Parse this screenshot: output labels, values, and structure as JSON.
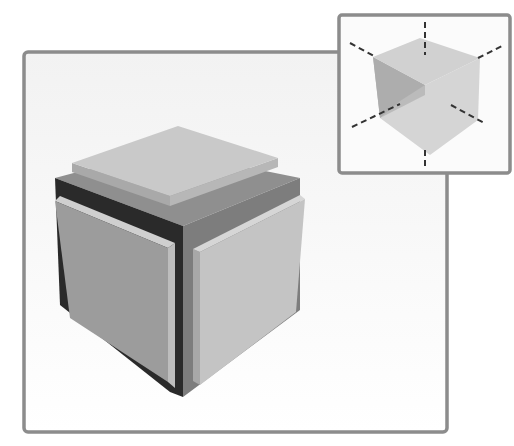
{
  "canvas": {
    "width": 514,
    "height": 446,
    "background": "#ffffff"
  },
  "main_panel": {
    "label": "exploded-cube-view",
    "frame": {
      "x": 24,
      "y": 52,
      "w": 423,
      "h": 380,
      "rx": 4,
      "stroke": "#8c8c8c",
      "stroke_width": 3.5,
      "fill_top": "#f2f2f2",
      "fill_bottom": "#ffffff"
    },
    "core": {
      "top": {
        "points": "55,178 160,150 300,178 183,226",
        "fill": "#8f8f8f"
      },
      "left": {
        "points": "55,178 183,226 183,397 170,392 60,305",
        "fill": "#2a2a2a"
      },
      "right": {
        "points": "183,226 300,178 300,310 183,397",
        "fill": "#7d7d7d"
      }
    },
    "plates": {
      "top": {
        "face": {
          "points": "72,163 178,126 278,158 170,196",
          "fill": "#c9c9c9"
        },
        "edge_front_left": {
          "points": "72,163 170,196 170,206 72,172",
          "fill": "#a9a9a9"
        },
        "edge_front_right": {
          "points": "170,196 278,158 278,167 170,206",
          "fill": "#b7b7b7"
        }
      },
      "left": {
        "face": {
          "points": "55,201 168,248 168,382 70,318",
          "fill": "#9c9c9c"
        },
        "edge": {
          "points": "55,201 60,196 175,243 168,248",
          "fill": "#cfcfcf"
        },
        "side": {
          "points": "168,248 175,243 175,388 168,382",
          "fill": "#bdbdbd"
        }
      },
      "right": {
        "face": {
          "points": "200,252 305,199 296,312 200,385",
          "fill": "#c4c4c4"
        },
        "edge": {
          "points": "193,249 300,195 305,199 200,252",
          "fill": "#d6d6d6"
        },
        "side": {
          "points": "193,249 200,252 200,385 193,381",
          "fill": "#a8a8a8"
        }
      }
    }
  },
  "inset_panel": {
    "label": "axes-reference-cube",
    "frame": {
      "x": 339,
      "y": 15,
      "w": 171,
      "h": 158,
      "rx": 3,
      "stroke": "#8c8c8c",
      "stroke_width": 3.5,
      "fill": "#fbfbfb"
    },
    "cube": {
      "top": {
        "points": "373,57 420,38 480,58 425,85",
        "fill": "#cfcfcf"
      },
      "left": {
        "points": "373,57 425,85 425,95 380,118",
        "fill": "#b8b8b8"
      },
      "back": {
        "points": "425,85 480,58 478,120 430,155 380,118",
        "fill": "#d3d3d3"
      },
      "shade": {
        "points": "373,57 425,85 400,101 380,118",
        "fill": "#a9a9a9"
      }
    },
    "axes": [
      {
        "name": "vertical-up",
        "x1": 425,
        "y1": 22,
        "x2": 425,
        "y2": 55
      },
      {
        "name": "vertical-down",
        "x1": 425,
        "y1": 150,
        "x2": 425,
        "y2": 168
      },
      {
        "name": "left-up",
        "x1": 350,
        "y1": 43,
        "x2": 374,
        "y2": 56
      },
      {
        "name": "right-up",
        "x1": 478,
        "y1": 58,
        "x2": 504,
        "y2": 45
      },
      {
        "name": "left-down",
        "x1": 352,
        "y1": 127,
        "x2": 400,
        "y2": 104
      },
      {
        "name": "right-down",
        "x1": 451,
        "y1": 105,
        "x2": 486,
        "y2": 124
      }
    ],
    "axis_style": {
      "stroke": "#333333",
      "stroke_width": 2,
      "dash": "6,4"
    }
  }
}
